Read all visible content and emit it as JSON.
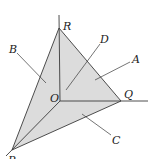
{
  "diagram": {
    "type": "tetrahedron-coordinate-figure",
    "colors": {
      "face_fill": "#dcdcdc",
      "line": "#3a3a3a",
      "label": "#222222",
      "background": "#ffffff"
    },
    "vertices": {
      "O": {
        "label": "O"
      },
      "P": {
        "label": "P"
      },
      "Q": {
        "label": "Q"
      },
      "R": {
        "label": "R"
      }
    },
    "faces": {
      "A": {
        "label": "A",
        "description": "face OQR"
      },
      "B": {
        "label": "B",
        "description": "face OPR"
      },
      "C": {
        "label": "C",
        "description": "face OPQ"
      },
      "D": {
        "label": "D",
        "description": "face PQR"
      }
    }
  }
}
